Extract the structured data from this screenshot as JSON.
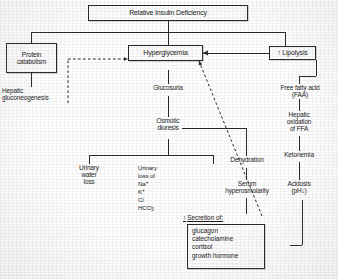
{
  "diagram": {
    "title": "Relative Insulin Deficiency",
    "type": "flowchart",
    "arrow_up": "↑",
    "arrow_down": "↓",
    "nodes": {
      "relative_insulin_deficiency": "Relative Insulin Deficiency",
      "protein_catabolism": "Protein\ncatabolism",
      "protein_catabolism_line1": "Protein",
      "protein_catabolism_line2": "catabolism",
      "hepatic_gluconeogenesis_line1": "Hepatic",
      "hepatic_gluconeogenesis_line2": "gluconeogenesis",
      "hyperglycemia": "Hyperglycemia",
      "glucosuria": "Glucosuria",
      "osmotic_diuresis_line1": "Osmotic",
      "osmotic_diuresis_line2": "diuresis",
      "urinary_water_loss_line1": "Urinary",
      "urinary_water_loss_line2": "water",
      "urinary_water_loss_line3": "loss",
      "urinary_loss_line1": "Urinary",
      "urinary_loss_line2": "loss of",
      "ion_na": "Na",
      "ion_k": "K",
      "ion_cl": "Cl",
      "ion_hco3": "HCO",
      "ion_na_charge": "+",
      "ion_k_charge": "+",
      "ion_hco3_sub": "3",
      "dehydration": "Dehydration",
      "serum_hyperosmolarity_line1": "Serum",
      "serum_hyperosmolarity_line2": "hyperosmolarity",
      "lipolysis": "Lipolysis",
      "free_fatty_acid_line1": "Free fatty acid",
      "free_fatty_acid_line2": "(FAA)",
      "hepatic_oxidation_line1": "Hepatic",
      "hepatic_oxidation_line2": "oxidation",
      "hepatic_oxidation_line3": "of FFA",
      "ketonemia": "Ketonemia",
      "acidosis_line1": "Acidosis",
      "acidosis_line2": "(pH",
      "acidosis_line2_end": ")",
      "secretion_header": "Secretion of:",
      "hormones": [
        "glucagon",
        "catecholamine",
        "cortisol",
        "growth hormone"
      ]
    },
    "colors": {
      "ink": "#1c1c1c",
      "border": "#2b2b2b",
      "paper": "#ffffff",
      "box_fill": "#fdfdfd"
    }
  }
}
